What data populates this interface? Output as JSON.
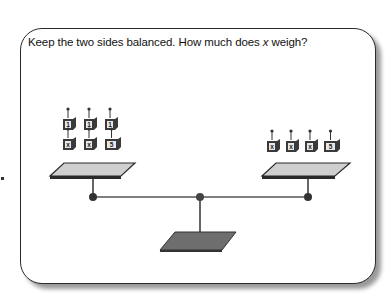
{
  "prompt": {
    "before_var": "Keep the two sides balanced. How much does ",
    "variable": "x",
    "after_var": " weigh?"
  },
  "scale": {
    "left_pan": {
      "weights": [
        {
          "label": "1",
          "row": "top"
        },
        {
          "label": "1",
          "row": "top"
        },
        {
          "label": "1",
          "row": "top"
        },
        {
          "label": "x",
          "row": "bottom"
        },
        {
          "label": "x",
          "row": "bottom"
        },
        {
          "label": "5",
          "row": "bottom"
        }
      ]
    },
    "right_pan": {
      "weights": [
        {
          "label": "x"
        },
        {
          "label": "x"
        },
        {
          "label": "x"
        },
        {
          "label": "5"
        }
      ]
    }
  },
  "colors": {
    "pan_fill": "#cfcfcf",
    "pan_edge": "#2a2a2a",
    "base_fill": "#6e6e6e",
    "weight_fill": "#3a3a3a",
    "beam": "#555555"
  }
}
